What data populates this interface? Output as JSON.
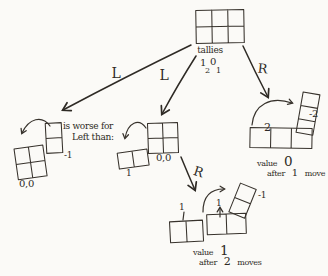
{
  "colors": {
    "ink": "#37322c",
    "paper": "#fbfaf7"
  },
  "root_node": {
    "caption": "tallies",
    "tally": {
      "d1": "1",
      "s1": "2",
      "d2": "0",
      "s2": "1"
    }
  },
  "edges": {
    "L1": "L",
    "L2": "L",
    "R1": "R",
    "R2": "R"
  },
  "note": {
    "line1": "is worse for",
    "line2": "Left than:"
  },
  "left_node": {
    "move_value": "-1",
    "tallies": "0,0"
  },
  "middle_node": {
    "move_value": "1",
    "tallies": "0,0"
  },
  "right_node": {
    "row_move_value": "2",
    "col_move_value": "-2",
    "caption": {
      "word": "value",
      "value": "0",
      "after": "after",
      "count": "1",
      "unit": "move"
    }
  },
  "bottom_node": {
    "diag_move_value": "-1",
    "up_move_value": "1",
    "result_value": "1",
    "caption": {
      "word": "value",
      "value": "1",
      "after": "after",
      "count": "2",
      "unit": "moves"
    }
  }
}
